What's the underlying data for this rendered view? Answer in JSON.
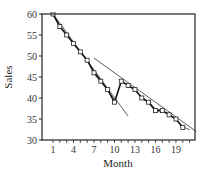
{
  "chart_data": {
    "type": "line",
    "title": "",
    "xlabel": "Month",
    "ylabel": "Sales",
    "xlim": [
      0,
      22
    ],
    "ylim": [
      30,
      60
    ],
    "x_ticks": [
      1,
      4,
      7,
      10,
      13,
      16,
      19
    ],
    "x_minor_ticks": [
      1,
      2,
      3,
      4,
      5,
      6,
      7,
      8,
      9,
      10,
      11,
      12,
      13,
      14,
      15,
      16,
      17,
      18,
      19,
      20,
      21
    ],
    "y_ticks": [
      30,
      35,
      40,
      45,
      50,
      55,
      60
    ],
    "grid": false,
    "legend": null,
    "series": [
      {
        "name": "Sales",
        "style": "thick line with open square markers",
        "x": [
          1,
          2,
          3,
          4,
          5,
          6,
          7,
          8,
          9,
          10,
          11,
          12,
          13,
          14,
          15,
          16,
          17,
          18,
          19,
          20
        ],
        "values": [
          60,
          57,
          55,
          53,
          51,
          49,
          46,
          44,
          42,
          39,
          44,
          43,
          42,
          40,
          39,
          37,
          37,
          36,
          35,
          33
        ]
      },
      {
        "name": "Trend line (months 1-10)",
        "style": "thin line",
        "x": [
          1,
          12
        ],
        "values": [
          60,
          35.7
        ]
      },
      {
        "name": "Trend line (months 11-20)",
        "style": "thin line",
        "x": [
          7,
          22
        ],
        "values": [
          49.5,
          32
        ]
      },
      {
        "name": "Smoothed fit (months 1-10)",
        "style": "thin line",
        "x": [
          1,
          2,
          3,
          4,
          5,
          6,
          7,
          8,
          9,
          10
        ],
        "values": [
          60,
          57.2,
          55,
          53,
          51,
          48.8,
          46.4,
          44.2,
          41.8,
          39.6
        ]
      },
      {
        "name": "Smoothed fit (months 11-20)",
        "style": "thin line",
        "x": [
          11,
          12,
          13,
          14,
          15,
          16,
          17,
          18,
          19,
          20,
          21
        ],
        "values": [
          44,
          43,
          41.8,
          40.2,
          39,
          37.4,
          37,
          36,
          35,
          33.2,
          32.4
        ]
      }
    ]
  }
}
